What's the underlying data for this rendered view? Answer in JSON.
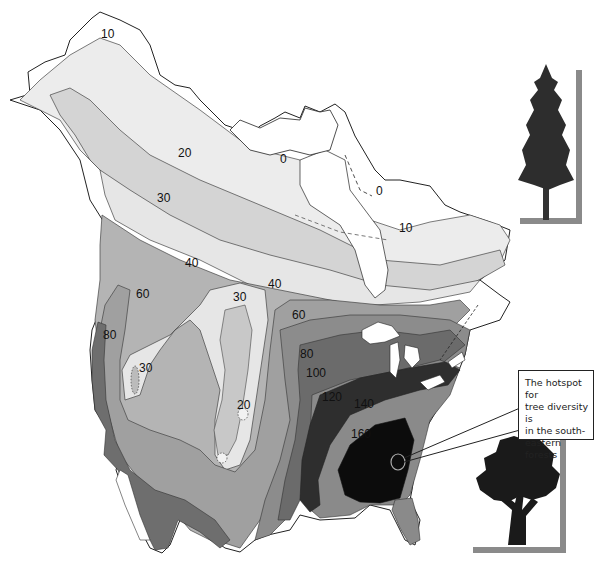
{
  "map": {
    "title": "Tree species richness across North America",
    "region": "North America",
    "contour_labels": [
      {
        "value": "10",
        "x": 107,
        "y": 34
      },
      {
        "value": "0",
        "x": 279,
        "y": 154
      },
      {
        "value": "0",
        "x": 378,
        "y": 187
      },
      {
        "value": "20",
        "x": 177,
        "y": 149
      },
      {
        "value": "30",
        "x": 157,
        "y": 193
      },
      {
        "value": "10",
        "x": 397,
        "y": 222
      },
      {
        "value": "40",
        "x": 184,
        "y": 257
      },
      {
        "value": "40",
        "x": 268,
        "y": 282
      },
      {
        "value": "30",
        "x": 234,
        "y": 296
      },
      {
        "value": "60",
        "x": 135,
        "y": 291
      },
      {
        "value": "60",
        "x": 292,
        "y": 311
      },
      {
        "value": "80",
        "x": 103,
        "y": 332
      },
      {
        "value": "30",
        "x": 138,
        "y": 367
      },
      {
        "value": "80",
        "x": 299,
        "y": 350
      },
      {
        "value": "100",
        "x": 305,
        "y": 368
      },
      {
        "value": "20",
        "x": 236,
        "y": 400
      },
      {
        "value": "120",
        "x": 321,
        "y": 391
      },
      {
        "value": "140",
        "x": 354,
        "y": 399
      },
      {
        "value": "160",
        "x": 350,
        "y": 430
      }
    ],
    "shades": {
      "0": "#ffffff",
      "10": "#ececec",
      "20": "#d4d4d4",
      "30": "#e6e6e6",
      "40": "#b4b4b4",
      "60": "#a0a0a0",
      "80": "#7a7a7a",
      "100": "#8c8c8c",
      "120": "#6b6b6b",
      "140": "#2e2e2e",
      "160": "#0c0c0c"
    }
  },
  "callout": {
    "text": "The hotspot for tree diversity is in the south-eastern forests",
    "lines": [
      "The hotspot for",
      "tree diversity is",
      "in the south-",
      "eastern forests"
    ]
  },
  "illustrations": {
    "top": "conifer-tree",
    "bottom": "deciduous-tree"
  }
}
